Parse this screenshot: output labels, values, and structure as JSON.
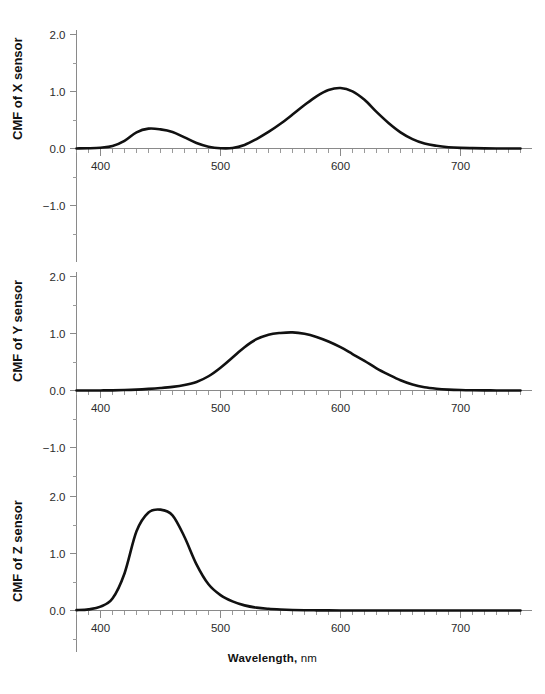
{
  "figure": {
    "xaxis_title_main": "Wavelength,",
    "xaxis_title_unit": "nm"
  },
  "panels": [
    {
      "id": "x",
      "ylabel": "CMF of X sensor",
      "ytick_labels": [
        "2.0",
        "1.0",
        "0.0",
        "-1.0"
      ],
      "xtick_labels": [
        "400",
        "500",
        "600",
        "700"
      ]
    },
    {
      "id": "y",
      "ylabel": "CMF of Y sensor",
      "ytick_labels": [
        "2.0",
        "1.0",
        "0.0",
        "-1.0"
      ],
      "xtick_labels": [
        "400",
        "500",
        "600",
        "700"
      ]
    },
    {
      "id": "z",
      "ylabel": "CMF of Z sensor",
      "ytick_labels": [
        "2.0",
        "1.0",
        "0.0"
      ],
      "xtick_labels": [
        "400",
        "500",
        "600",
        "700"
      ]
    }
  ],
  "chart_data": [
    {
      "type": "line",
      "title": "CMF of X sensor",
      "xlabel": "Wavelength, nm",
      "ylabel": "CMF of X sensor",
      "xlim": [
        380,
        750
      ],
      "ylim": [
        -1.5,
        2.2
      ],
      "grid": false,
      "legend": "none",
      "xticks_major": [
        400,
        500,
        600,
        700
      ],
      "xtick_minor_step": 10,
      "yticks_major": [
        -1.0,
        0.0,
        1.0,
        2.0
      ],
      "ytick_minor_step": 0.5,
      "series": [
        {
          "name": "x-bar",
          "x": [
            380,
            390,
            400,
            410,
            420,
            430,
            440,
            450,
            460,
            470,
            480,
            490,
            500,
            510,
            520,
            530,
            540,
            550,
            560,
            570,
            580,
            590,
            600,
            610,
            620,
            630,
            640,
            650,
            660,
            670,
            680,
            690,
            700,
            710,
            720,
            730,
            740,
            750
          ],
          "values": [
            0.001,
            0.004,
            0.014,
            0.044,
            0.134,
            0.284,
            0.348,
            0.336,
            0.291,
            0.195,
            0.096,
            0.032,
            0.005,
            0.009,
            0.063,
            0.166,
            0.29,
            0.433,
            0.595,
            0.762,
            0.916,
            1.026,
            1.062,
            1.003,
            0.854,
            0.642,
            0.448,
            0.284,
            0.165,
            0.087,
            0.047,
            0.023,
            0.011,
            0.006,
            0.003,
            0.001,
            0.001,
            0.0
          ]
        }
      ],
      "peaks": [
        {
          "x": 445,
          "y": 0.37,
          "label": "secondary blue peak"
        },
        {
          "x": 600,
          "y": 1.08,
          "label": "primary red peak"
        }
      ],
      "minima": [
        {
          "x": 505,
          "y": 0.0
        }
      ]
    },
    {
      "type": "line",
      "title": "CMF of Y sensor",
      "xlabel": "Wavelength, nm",
      "ylabel": "CMF of Y sensor",
      "xlim": [
        380,
        750
      ],
      "ylim": [
        -1.5,
        2.2
      ],
      "grid": false,
      "legend": "none",
      "xticks_major": [
        400,
        500,
        600,
        700
      ],
      "xtick_minor_step": 10,
      "yticks_major": [
        -1.0,
        0.0,
        1.0,
        2.0
      ],
      "ytick_minor_step": 0.5,
      "series": [
        {
          "name": "y-bar",
          "x": [
            380,
            390,
            400,
            410,
            420,
            430,
            440,
            450,
            460,
            470,
            480,
            490,
            500,
            510,
            520,
            530,
            540,
            550,
            560,
            570,
            580,
            590,
            600,
            610,
            620,
            630,
            640,
            650,
            660,
            670,
            680,
            690,
            700,
            710,
            720,
            730,
            740,
            750
          ],
          "values": [
            0.0,
            0.0,
            0.001,
            0.003,
            0.008,
            0.016,
            0.028,
            0.043,
            0.063,
            0.095,
            0.15,
            0.25,
            0.4,
            0.58,
            0.76,
            0.9,
            0.98,
            1.01,
            1.02,
            0.995,
            0.94,
            0.86,
            0.76,
            0.64,
            0.52,
            0.39,
            0.28,
            0.18,
            0.105,
            0.057,
            0.031,
            0.016,
            0.008,
            0.004,
            0.002,
            0.001,
            0.0,
            0.0
          ]
        }
      ],
      "peaks": [
        {
          "x": 555,
          "y": 1.02,
          "label": "luminance peak"
        }
      ]
    },
    {
      "type": "line",
      "title": "CMF of Z sensor",
      "xlabel": "Wavelength, nm",
      "ylabel": "CMF of Z sensor",
      "xlim": [
        380,
        750
      ],
      "ylim": [
        -0.6,
        2.2
      ],
      "grid": false,
      "legend": "none",
      "xticks_major": [
        400,
        500,
        600,
        700
      ],
      "xtick_minor_step": 10,
      "yticks_major": [
        0.0,
        1.0,
        2.0
      ],
      "ytick_minor_step": 0.5,
      "series": [
        {
          "name": "z-bar",
          "x": [
            380,
            390,
            400,
            410,
            420,
            430,
            440,
            450,
            460,
            470,
            480,
            490,
            500,
            510,
            520,
            530,
            540,
            550,
            560,
            570,
            580,
            590,
            600,
            610,
            620,
            630,
            640,
            650,
            660,
            670,
            680,
            690,
            700,
            710,
            720,
            730,
            740,
            750
          ],
          "values": [
            0.006,
            0.02,
            0.068,
            0.21,
            0.65,
            1.39,
            1.72,
            1.77,
            1.67,
            1.29,
            0.81,
            0.46,
            0.27,
            0.16,
            0.09,
            0.05,
            0.03,
            0.018,
            0.01,
            0.005,
            0.003,
            0.002,
            0.001,
            0.001,
            0.0,
            0.0,
            0.0,
            0.0,
            0.0,
            0.0,
            0.0,
            0.0,
            0.0,
            0.0,
            0.0,
            0.0,
            0.0,
            0.0
          ]
        }
      ],
      "peaks": [
        {
          "x": 448,
          "y": 1.78,
          "label": "blue peak"
        }
      ]
    }
  ],
  "colors": {
    "curve": "#111111",
    "axis": "#8a8a8a",
    "text": "#1a1a1a",
    "background": "#ffffff"
  }
}
